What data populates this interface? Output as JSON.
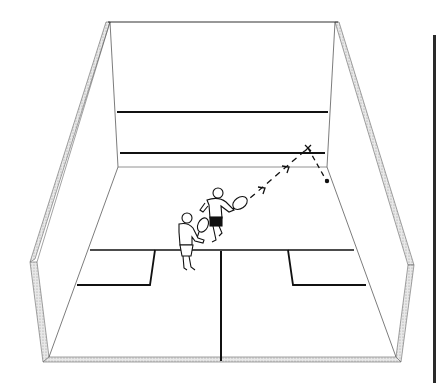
{
  "illustration": {
    "subject": "squash court with two players",
    "colors": {
      "line": "#111111",
      "wall_outline": "#555555",
      "stipple": "#bdbdbd",
      "background": "#ffffff"
    },
    "elements": {
      "front_wall_lines": [
        "upper-line",
        "service-line"
      ],
      "floor_lines": [
        "short-line",
        "half-court-line",
        "left-service-box",
        "right-service-box"
      ],
      "shot_path": "dashed arrow from racquet to front wall, rebound to side wall",
      "impact_marker": "x",
      "ball": "dot"
    },
    "players": [
      {
        "id": "hitting-player",
        "shorts": "dark"
      },
      {
        "id": "waiting-player",
        "shorts": "light"
      }
    ]
  }
}
